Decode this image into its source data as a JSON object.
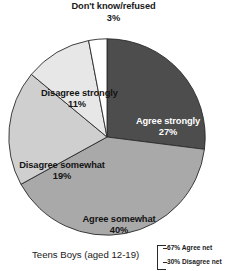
{
  "chart_data": {
    "type": "pie",
    "title": "",
    "categories": [
      "Agree strongly",
      "Agree somewhat",
      "Disagree somewhat",
      "Disagree strongly",
      "Don't know/refused"
    ],
    "values": [
      27,
      40,
      19,
      11,
      3
    ],
    "value_suffix": "%",
    "slices": [
      {
        "label": "Agree strongly",
        "value": "27%",
        "pct": 27,
        "color": "#4d4d4d",
        "text_color": "#ffffff"
      },
      {
        "label": "Agree somewhat",
        "value": "40%",
        "pct": 40,
        "color": "#a9a9a9",
        "text_color": "#141414"
      },
      {
        "label": "Disagree somewhat",
        "value": "19%",
        "pct": 19,
        "color": "#cfcfcf",
        "text_color": "#141414"
      },
      {
        "label": "Disagree strongly",
        "value": "11%",
        "pct": 11,
        "color": "#e7e7e7",
        "text_color": "#141414"
      },
      {
        "label": "Don't know/refused",
        "value": "3%",
        "pct": 3,
        "color": "#ffffff",
        "text_color": "#141414"
      }
    ],
    "start_angle_deg": 0,
    "direction": "clockwise",
    "legend": "none",
    "grid": false,
    "annotations": {
      "agree_net": "67% Agree net",
      "disagree_net": "30% Disagree net"
    },
    "caption": "Teens Boys (aged 12-19)"
  },
  "callout": {
    "label": "Don't know/refused",
    "value": "3%"
  },
  "slice_labels": {
    "agree_strongly": {
      "label": "Agree strongly",
      "value": "27%"
    },
    "agree_somewhat": {
      "label": "Agree somewhat",
      "value": "40%"
    },
    "disagree_somewhat": {
      "label": "Disagree somewhat",
      "value": "19%"
    },
    "disagree_strongly": {
      "label": "Disagree strongly",
      "value": "11%"
    }
  },
  "footer": {
    "caption": "Teens Boys (aged 12-19)",
    "agree_net": "67% Agree net",
    "disagree_net": "30% Disagree net"
  },
  "colors": {
    "agree_strongly": "#4d4d4d",
    "agree_somewhat": "#a9a9a9",
    "disagree_somewhat": "#cfcfcf",
    "disagree_strongly": "#e7e7e7",
    "dont_know": "#ffffff",
    "outline": "#2a2a2a"
  }
}
